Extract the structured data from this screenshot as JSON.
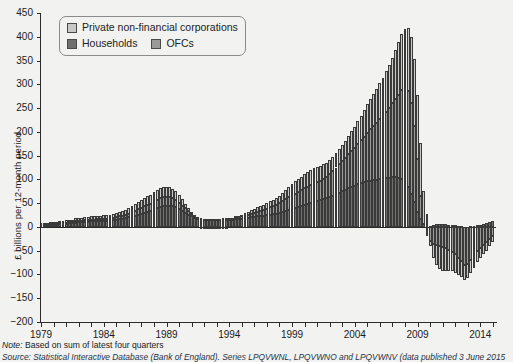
{
  "chart_data": {
    "type": "bar",
    "stacked": true,
    "title": "",
    "xlabel": "",
    "ylabel": "£ billions per 12-month period",
    "ylim": [
      -200,
      450
    ],
    "ytick_step": 50,
    "yticks": [
      450,
      400,
      350,
      300,
      250,
      200,
      150,
      100,
      50,
      0,
      -50,
      -100,
      -150,
      -200
    ],
    "ytick_labels": [
      "450",
      "400",
      "350",
      "300",
      "250",
      "200",
      "150",
      "100",
      "50",
      "0",
      "−50",
      "−100",
      "−150",
      "−200"
    ],
    "xlim": [
      1979,
      2015.25
    ],
    "xtick_labels": [
      "1979",
      "1984",
      "1989",
      "1994",
      "1999",
      "2004",
      "2009",
      "2014"
    ],
    "xtick_values": [
      1979,
      1984,
      1989,
      1994,
      1999,
      2004,
      2009,
      2014
    ],
    "xtick_minor_step": 1,
    "grid": false,
    "legend_position": "top-left",
    "legend": [
      {
        "name": "Private non-financial corporations",
        "color": "#c9c9c7"
      },
      {
        "name": "Households",
        "color": "#6f6f6d"
      },
      {
        "name": "OFCs",
        "color": "#9a9a98"
      }
    ],
    "series": [
      {
        "name": "Households",
        "color": "#6f6f6d"
      },
      {
        "name": "OFCs",
        "color": "#9a9a98"
      },
      {
        "name": "Private non-financial corporations",
        "color": "#c9c9c7"
      }
    ],
    "x": [
      1979.0,
      1979.25,
      1979.5,
      1979.75,
      1980.0,
      1980.25,
      1980.5,
      1980.75,
      1981.0,
      1981.25,
      1981.5,
      1981.75,
      1982.0,
      1982.25,
      1982.5,
      1982.75,
      1983.0,
      1983.25,
      1983.5,
      1983.75,
      1984.0,
      1984.25,
      1984.5,
      1984.75,
      1985.0,
      1985.25,
      1985.5,
      1985.75,
      1986.0,
      1986.25,
      1986.5,
      1986.75,
      1987.0,
      1987.25,
      1987.5,
      1987.75,
      1988.0,
      1988.25,
      1988.5,
      1988.75,
      1989.0,
      1989.25,
      1989.5,
      1989.75,
      1990.0,
      1990.25,
      1990.5,
      1990.75,
      1991.0,
      1991.25,
      1991.5,
      1991.75,
      1992.0,
      1992.25,
      1992.5,
      1992.75,
      1993.0,
      1993.25,
      1993.5,
      1993.75,
      1994.0,
      1994.25,
      1994.5,
      1994.75,
      1995.0,
      1995.25,
      1995.5,
      1995.75,
      1996.0,
      1996.25,
      1996.5,
      1996.75,
      1997.0,
      1997.25,
      1997.5,
      1997.75,
      1998.0,
      1998.25,
      1998.5,
      1998.75,
      1999.0,
      1999.25,
      1999.5,
      1999.75,
      2000.0,
      2000.25,
      2000.5,
      2000.75,
      2001.0,
      2001.25,
      2001.5,
      2001.75,
      2002.0,
      2002.25,
      2002.5,
      2002.75,
      2003.0,
      2003.25,
      2003.5,
      2003.75,
      2004.0,
      2004.25,
      2004.5,
      2004.75,
      2005.0,
      2005.25,
      2005.5,
      2005.75,
      2006.0,
      2006.25,
      2006.5,
      2006.75,
      2007.0,
      2007.25,
      2007.5,
      2007.75,
      2008.0,
      2008.25,
      2008.5,
      2008.75,
      2009.0,
      2009.25,
      2009.5,
      2009.75,
      2010.0,
      2010.25,
      2010.5,
      2010.75,
      2011.0,
      2011.25,
      2011.5,
      2011.75,
      2012.0,
      2012.25,
      2012.5,
      2012.75,
      2013.0,
      2013.25,
      2013.5,
      2013.75,
      2014.0,
      2014.25,
      2014.5,
      2014.75,
      2015.0
    ],
    "values": {
      "Households": [
        4,
        4,
        5,
        5,
        5,
        5,
        6,
        6,
        7,
        8,
        8,
        9,
        10,
        10,
        11,
        11,
        12,
        12,
        12,
        12,
        13,
        13,
        13,
        14,
        15,
        16,
        17,
        18,
        20,
        22,
        24,
        26,
        28,
        30,
        32,
        34,
        37,
        40,
        42,
        44,
        45,
        45,
        44,
        42,
        38,
        34,
        30,
        26,
        22,
        19,
        17,
        16,
        15,
        14,
        14,
        14,
        14,
        14,
        15,
        15,
        15,
        15,
        16,
        16,
        17,
        18,
        19,
        20,
        21,
        22,
        23,
        24,
        25,
        26,
        27,
        28,
        30,
        32,
        34,
        36,
        38,
        40,
        42,
        44,
        46,
        48,
        50,
        52,
        54,
        56,
        58,
        60,
        63,
        66,
        69,
        72,
        75,
        78,
        81,
        84,
        87,
        90,
        92,
        94,
        96,
        97,
        98,
        99,
        100,
        101,
        102,
        103,
        104,
        104,
        103,
        101,
        95,
        85,
        70,
        52,
        32,
        16,
        6,
        2,
        2,
        4,
        6,
        7,
        7,
        6,
        5,
        4,
        3,
        2,
        1,
        0,
        0,
        1,
        2,
        3,
        5,
        7,
        9,
        11,
        12
      ],
      "OFCs": [
        1,
        1,
        1,
        1,
        1,
        1,
        2,
        2,
        2,
        2,
        2,
        3,
        3,
        3,
        3,
        3,
        3,
        3,
        4,
        4,
        4,
        4,
        5,
        5,
        5,
        6,
        6,
        7,
        8,
        9,
        10,
        11,
        12,
        13,
        14,
        15,
        16,
        17,
        18,
        18,
        18,
        17,
        16,
        15,
        13,
        11,
        9,
        7,
        5,
        4,
        3,
        3,
        2,
        2,
        2,
        2,
        2,
        2,
        3,
        3,
        3,
        3,
        4,
        4,
        5,
        6,
        7,
        8,
        9,
        10,
        11,
        12,
        13,
        15,
        16,
        18,
        20,
        22,
        24,
        26,
        28,
        30,
        32,
        34,
        36,
        37,
        38,
        39,
        40,
        41,
        43,
        45,
        48,
        52,
        56,
        60,
        64,
        68,
        72,
        76,
        80,
        85,
        90,
        96,
        102,
        108,
        114,
        120,
        126,
        133,
        140,
        148,
        156,
        165,
        175,
        186,
        196,
        200,
        190,
        160,
        110,
        50,
        0,
        -20,
        -30,
        -35,
        -38,
        -40,
        -42,
        -45,
        -48,
        -52,
        -58,
        -65,
        -72,
        -80,
        -78,
        -70,
        -60,
        -50,
        -44,
        -38,
        -32,
        -26,
        -20,
        -14,
        -8,
        -4,
        0
      ],
      "Private non-financial corporations": [
        3,
        3,
        3,
        4,
        4,
        4,
        4,
        4,
        5,
        5,
        5,
        6,
        6,
        6,
        6,
        7,
        7,
        7,
        7,
        7,
        8,
        8,
        8,
        9,
        9,
        10,
        10,
        11,
        12,
        13,
        14,
        15,
        16,
        17,
        18,
        19,
        20,
        21,
        22,
        22,
        22,
        21,
        20,
        18,
        16,
        13,
        10,
        7,
        4,
        2,
        0,
        -1,
        -2,
        -3,
        -3,
        -3,
        -3,
        -3,
        -2,
        -1,
        0,
        1,
        2,
        3,
        4,
        5,
        6,
        7,
        8,
        9,
        10,
        11,
        12,
        13,
        14,
        15,
        16,
        18,
        20,
        22,
        24,
        26,
        27,
        28,
        29,
        30,
        31,
        32,
        32,
        32,
        31,
        30,
        29,
        29,
        30,
        31,
        33,
        35,
        38,
        41,
        44,
        48,
        52,
        56,
        60,
        64,
        68,
        72,
        76,
        80,
        85,
        90,
        96,
        103,
        110,
        118,
        126,
        134,
        140,
        142,
        135,
        110,
        70,
        25,
        -10,
        -30,
        -42,
        -48,
        -50,
        -48,
        -44,
        -40,
        -38,
        -36,
        -34,
        -32,
        -30,
        -28,
        -26,
        -24,
        -22,
        -20,
        -18,
        -15,
        -12,
        -9,
        -6,
        -3,
        0
      ]
    },
    "notable_points": [
      {
        "label": "peak total",
        "x": 2007.75,
        "value": 425
      },
      {
        "label": "late-1980s peak total",
        "x": 1989.0,
        "value": 85
      },
      {
        "label": "deepest trough",
        "x": 2012.75,
        "value": -165
      }
    ]
  },
  "annotations": {
    "note_prefix": "Note:",
    "note_text": "Based on sum of latest four quarters",
    "source_text": "Source: Statistical Interactive Database (Bank of England). Series LPQVWNL, LPQVWNO and LPQVWNV (data published 3 June 2015"
  }
}
